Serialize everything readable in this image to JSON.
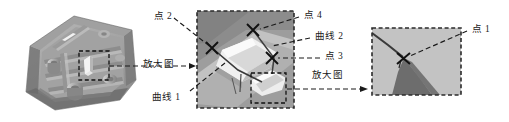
{
  "figure": {
    "panels": [
      {
        "id": "panel-part-3d",
        "name": "三维零件图",
        "description": "3D CAD rendering of a ribbed cover plate with bosses",
        "selection_box": "dashed-region"
      },
      {
        "id": "panel-zoom-1",
        "name": "第一级放大图",
        "description": "Enlarged 3D view of rib feature with X point markers",
        "selection_box": "dashed-region"
      },
      {
        "id": "panel-zoom-2",
        "name": "第二级放大图",
        "description": "Further enlarged view showing curve intersection point"
      }
    ],
    "labels": {
      "point_2": "点 2",
      "point_3": "点 3",
      "point_4": "点 4",
      "point_1": "点 1",
      "curve_1": "曲线 1",
      "curve_2": "曲线 2",
      "enlarged_view_left": "放大图",
      "enlarged_view_middle": "放大图"
    },
    "colors": {
      "leader_line": "#1a1a1a",
      "label_text": "#1a1a1a",
      "panel_border": "#2b2b2b",
      "surface_light": "#c9c9c9",
      "surface_mid": "#a8a8a8",
      "surface_dark": "#7d7d7d",
      "surface_darkest": "#5a5a5a",
      "highlight": "#eeeeee",
      "background": "#ffffff"
    }
  }
}
